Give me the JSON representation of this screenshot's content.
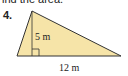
{
  "instruction_text": "ind the area.",
  "problem_number": "4.",
  "figure": {
    "shape": "triangle",
    "height_label": "5 m",
    "base_label": "12 m",
    "fill_color": "#f6e4a8",
    "stroke_color": "#333333",
    "right_angle_marker": true
  }
}
